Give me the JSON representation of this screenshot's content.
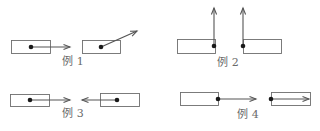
{
  "figure": {
    "examples": [
      {
        "id": "ex1",
        "label": "例 1",
        "label_pos": {
          "x": 73,
          "y": 56
        },
        "items": [
          {
            "box": {
              "x": 11,
              "y": 40,
              "w": 39,
              "h": 13
            },
            "dot": {
              "x": 31,
              "y": 47
            },
            "arrow_to": {
              "x": 70,
              "y": 47
            },
            "direction": "right"
          },
          {
            "box": {
              "x": 82,
              "y": 40,
              "w": 38,
              "h": 13
            },
            "dot": {
              "x": 101,
              "y": 47
            },
            "arrow_to": {
              "x": 137,
              "y": 31
            },
            "direction": "up-right"
          }
        ]
      },
      {
        "id": "ex2",
        "label": "例 2",
        "label_pos": {
          "x": 228,
          "y": 57
        },
        "items": [
          {
            "box": {
              "x": 177,
              "y": 39,
              "w": 38,
              "h": 14
            },
            "dot": {
              "x": 214,
              "y": 46
            },
            "arrow_to": {
              "x": 214,
              "y": 8
            },
            "direction": "up"
          },
          {
            "box": {
              "x": 243,
              "y": 39,
              "w": 38,
              "h": 14
            },
            "dot": {
              "x": 243,
              "y": 46
            },
            "arrow_to": {
              "x": 243,
              "y": 8
            },
            "direction": "up"
          }
        ]
      },
      {
        "id": "ex3",
        "label": "例 3",
        "label_pos": {
          "x": 73,
          "y": 108
        },
        "items": [
          {
            "box": {
              "x": 10,
              "y": 94,
              "w": 39,
              "h": 12
            },
            "dot": {
              "x": 30,
              "y": 100
            },
            "arrow_to": {
              "x": 70,
              "y": 100
            },
            "direction": "right"
          },
          {
            "box": {
              "x": 100,
              "y": 93,
              "w": 39,
              "h": 13
            },
            "dot": {
              "x": 117,
              "y": 100
            },
            "arrow_to": {
              "x": 82,
              "y": 100
            },
            "direction": "left"
          }
        ]
      },
      {
        "id": "ex4",
        "label": "例 4",
        "label_pos": {
          "x": 248,
          "y": 109
        },
        "items": [
          {
            "box": {
              "x": 180,
              "y": 92,
              "w": 38,
              "h": 13
            },
            "dot": {
              "x": 218,
              "y": 99
            },
            "arrow_to": {
              "x": 256,
              "y": 99
            },
            "direction": "right"
          },
          {
            "box": {
              "x": 271,
              "y": 92,
              "w": 39,
              "h": 13
            },
            "dot": {
              "x": 271,
              "y": 99
            },
            "arrow_to": {
              "x": 309,
              "y": 99
            },
            "direction": "right"
          }
        ]
      }
    ],
    "colors": {
      "box_stroke": "#6e6e6e",
      "arrow": "#555555",
      "dot": "#1a1a1a",
      "label": "#6a6a6a",
      "background": "#ffffff"
    }
  }
}
